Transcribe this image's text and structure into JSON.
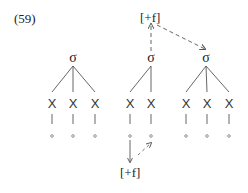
{
  "example_number": "(59)",
  "feature_top": "[+f]",
  "feature_bottom": "[+f]",
  "syllables": [
    {
      "label": "σ",
      "skeleton": [
        "X",
        "X",
        "X"
      ]
    },
    {
      "label": "σ",
      "skeleton": [
        "X",
        "X"
      ]
    },
    {
      "label": "σ",
      "skeleton": [
        "X",
        "X",
        "X"
      ]
    }
  ],
  "colors": {
    "ink": "#222222",
    "line": "#555555",
    "dashed": "#666666"
  }
}
